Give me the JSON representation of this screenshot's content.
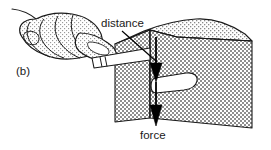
{
  "figure": {
    "panel_label": "(b)",
    "caption_labels": {
      "distance": "distance",
      "force": "force"
    },
    "colors": {
      "outline": "#1a1a1a",
      "front_face_fill": "#a8a8a8",
      "top_face_fill": "#dcdcdc",
      "hand_fill": "#e2e2e2",
      "slot_fill": "#ffffff",
      "background": "#ffffff",
      "arrow": "#000000"
    },
    "elements": {
      "hand": "hand-fist-with-index-finger",
      "tool": "chisel-rod",
      "block": "stone-block-with-slot",
      "slot": "white-rounded-slot",
      "distance_arrow": "downward-arrow-short",
      "force_arrow": "downward-arrow-long",
      "leader_line": "distance-leader-line"
    },
    "annotations": {
      "distance_label_x": 101,
      "distance_label_y": 27,
      "force_label_x": 140,
      "force_label_y": 139,
      "panel_label_x": 16,
      "panel_label_y": 75
    }
  }
}
